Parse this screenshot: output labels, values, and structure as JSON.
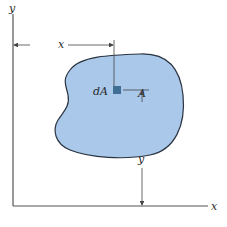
{
  "figure": {
    "type": "area-centroid-diagram",
    "colors": {
      "region_fill": "#a9c8ea",
      "region_stroke": "#2a3340",
      "element_fill": "#3f6f94",
      "axis": "#555555",
      "dimension": "#444444"
    },
    "labels": {
      "y_axis": "y",
      "x_axis": "x",
      "x_dimension": "x",
      "y_dimension": "y",
      "area": "A",
      "element": "dA"
    }
  }
}
